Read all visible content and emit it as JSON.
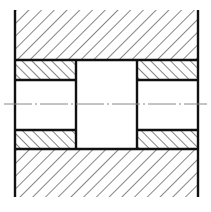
{
  "diagram": {
    "type": "technical-section-drawing",
    "colors": {
      "background": "#ffffff",
      "outline": "#111111",
      "hatch": "#222222",
      "centerline": "#888888"
    },
    "regions": [
      {
        "name": "upper-housing",
        "hatch": "forward-diagonal"
      },
      {
        "name": "upper-left-sleeve",
        "hatch": "back-diagonal"
      },
      {
        "name": "upper-right-sleeve",
        "hatch": "back-diagonal"
      },
      {
        "name": "lower-left-sleeve",
        "hatch": "back-diagonal"
      },
      {
        "name": "lower-right-sleeve",
        "hatch": "back-diagonal"
      },
      {
        "name": "lower-housing",
        "hatch": "forward-diagonal"
      },
      {
        "name": "center-bore",
        "hatch": "none"
      }
    ],
    "centerline": {
      "style": "dash-dot"
    }
  }
}
